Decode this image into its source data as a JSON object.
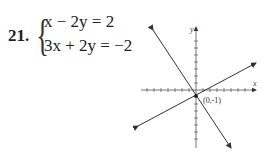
{
  "problem": {
    "number": "21.",
    "equations": [
      "x − 2y = 2",
      "3x + 2y = −2"
    ]
  },
  "graph": {
    "x_axis_label": "x",
    "y_axis_label": "y",
    "intersection_label": "(0,-1)"
  },
  "chart_data": {
    "type": "line",
    "title": "",
    "xlabel": "x",
    "ylabel": "y",
    "series": [
      {
        "name": "x - 2y = 2",
        "points": [
          [
            -8,
            -5
          ],
          [
            8,
            3
          ]
        ]
      },
      {
        "name": "3x + 2y = -2",
        "points": [
          [
            -6,
            8
          ],
          [
            5.3,
            -9
          ]
        ]
      }
    ],
    "annotations": [
      {
        "x": 0,
        "y": -1,
        "text": "(0,-1)"
      }
    ],
    "grid": false,
    "xlim": [
      -8,
      8
    ],
    "ylim": [
      -8,
      8
    ]
  }
}
